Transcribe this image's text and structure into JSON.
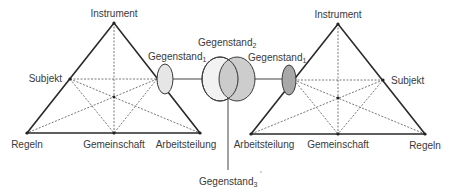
{
  "diagram": {
    "type": "activity-theory-networked-triangles",
    "left_triangle": {
      "labels": {
        "top": "Instrument",
        "left_mid": "Subjekt",
        "bottom_left": "Regeln",
        "bottom_mid": "Gemeinschaft",
        "bottom_right": "Arbeitsteilung"
      },
      "object": {
        "base": "Gegenstand",
        "subscript": "1"
      }
    },
    "right_triangle": {
      "labels": {
        "top": "Instrument",
        "right_mid": "Subjekt",
        "bottom_left": "Arbeitsteilung",
        "bottom_mid": "Gemeinschaft",
        "bottom_right": "Regeln"
      },
      "object": {
        "base": "Gegenstand",
        "subscript": "1"
      }
    },
    "shared_object": {
      "base": "Gegenstand",
      "subscript": "2"
    },
    "emergent_object": {
      "base": "Gegenstand",
      "subscript": "3"
    },
    "colors": {
      "left_object_fill": "#e6e6e6",
      "right_object_fill": "#a8a8a8",
      "shared_left_fill": "#f2f2f2",
      "shared_right_fill": "#c4c4c4",
      "shared_overlap_fill": "#b4b4b4",
      "line": "#2a2a2a"
    }
  }
}
